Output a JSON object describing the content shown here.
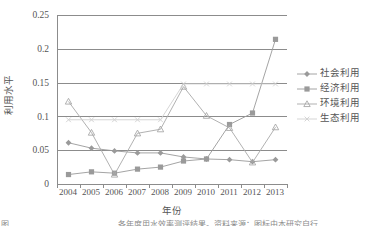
{
  "chart_data": {
    "type": "line",
    "title": "",
    "xlabel": "年份",
    "ylabel": "利用水平",
    "categories": [
      "2004",
      "2005",
      "2006",
      "2007",
      "2008",
      "2009",
      "2010",
      "2011",
      "2012",
      "2013"
    ],
    "ylim": [
      0,
      0.25
    ],
    "yticks": [
      "0",
      "0.05",
      "0.1",
      "0.15",
      "0.2",
      "0.25"
    ],
    "ytick_values": [
      0,
      0.05,
      0.1,
      0.15,
      0.2,
      0.25
    ],
    "grid": "horizontal",
    "legend_position": "right",
    "series": [
      {
        "name": "社会利用",
        "marker": "diamond",
        "color": "#9a9a9a",
        "values": [
          0.061,
          0.053,
          0.049,
          0.046,
          0.046,
          0.04,
          0.037,
          0.036,
          0.033,
          0.036
        ]
      },
      {
        "name": "经济利用",
        "marker": "square",
        "color": "#9a9a9a",
        "values": [
          0.014,
          0.018,
          0.016,
          0.022,
          0.025,
          0.034,
          0.037,
          0.088,
          0.105,
          0.214
        ]
      },
      {
        "name": "环境利用",
        "marker": "triangle",
        "color": "#a8a8a8",
        "values": [
          0.122,
          0.076,
          0.014,
          0.075,
          0.081,
          0.144,
          0.101,
          0.083,
          0.032,
          0.084
        ]
      },
      {
        "name": "生态利用",
        "marker": "cross",
        "color": "#d0d0d0",
        "values": [
          0.095,
          0.095,
          0.095,
          0.095,
          0.095,
          0.148,
          0.148,
          0.148,
          0.148,
          0.148
        ]
      }
    ]
  },
  "legend": {
    "items": [
      {
        "label": "社会利用"
      },
      {
        "label": "经济利用"
      },
      {
        "label": "环境利用"
      },
      {
        "label": "生态利用"
      }
    ]
  },
  "caption": {
    "left": "图",
    "right": "各年度用水效率测评结果。资料来源：图标由本研究自行"
  }
}
